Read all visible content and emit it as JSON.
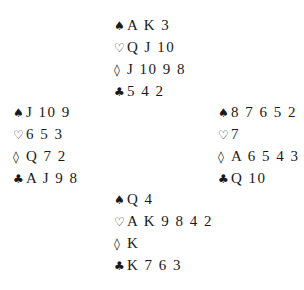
{
  "deal": {
    "north": {
      "spades": "A K 3",
      "hearts": "Q J 10",
      "diamonds": "J 10 9 8",
      "clubs": "5 4 2"
    },
    "west": {
      "spades": "J 10 9",
      "hearts": "6 5 3",
      "diamonds": "Q 7 2",
      "clubs": "A J 9 8"
    },
    "east": {
      "spades": "8 7 6 5 2",
      "hearts": "7",
      "diamonds": "A 6 5 4 3",
      "clubs": "Q 10"
    },
    "south": {
      "spades": "Q 4",
      "hearts": "A K 9 8 4 2",
      "diamonds": "K",
      "clubs": "K 7 6 3"
    }
  },
  "suit_symbols": {
    "spades": "♠",
    "hearts": "♡",
    "diamonds": "◊",
    "clubs": "♣"
  }
}
